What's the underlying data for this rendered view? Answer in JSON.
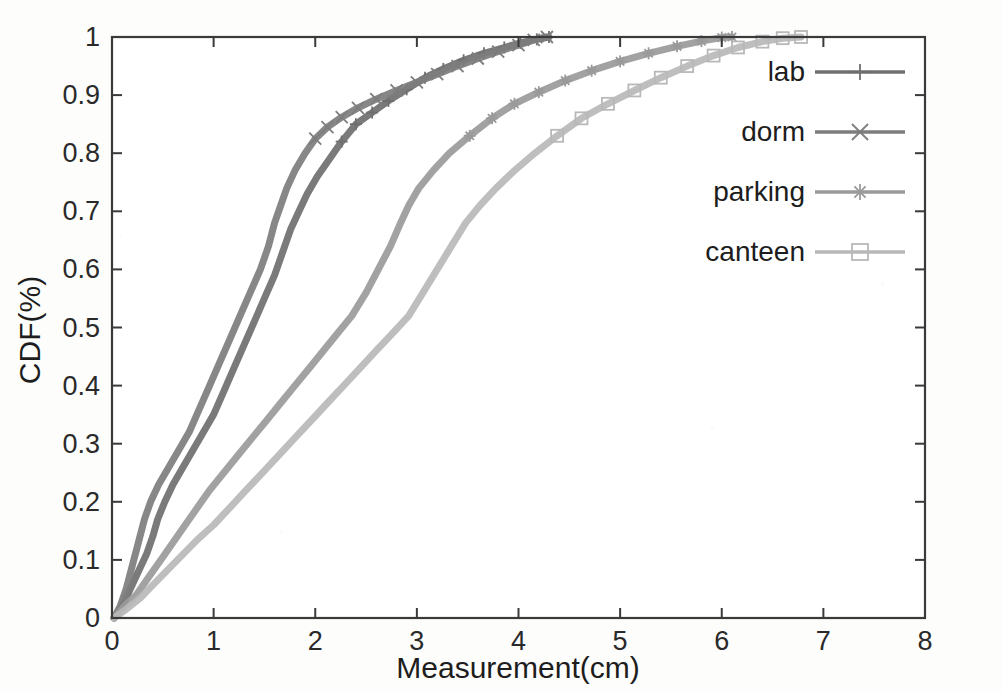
{
  "chart_data": {
    "type": "line",
    "title": "",
    "subtitle": "",
    "xlabel": "Measurement(cm)",
    "ylabel": "CDF(%)",
    "xlim": [
      0,
      8
    ],
    "ylim": [
      0,
      1
    ],
    "xticks": [
      "0",
      "1",
      "2",
      "3",
      "4",
      "5",
      "6",
      "7",
      "8"
    ],
    "xtick_values": [
      0,
      1,
      2,
      3,
      4,
      5,
      6,
      7,
      8
    ],
    "yticks": [
      "0",
      "0.1",
      "0.2",
      "0.3",
      "0.4",
      "0.5",
      "0.6",
      "0.7",
      "0.8",
      "0.9",
      "1"
    ],
    "ytick_values": [
      0,
      0.1,
      0.2,
      0.3,
      0.4,
      0.5,
      0.6,
      0.7,
      0.8,
      0.9,
      1
    ],
    "grid": false,
    "legend_position": "right",
    "series": [
      {
        "name": "lab",
        "marker": "plus",
        "color": "#6f6f6f",
        "points": [
          [
            0.02,
            0.0
          ],
          [
            0.1,
            0.02
          ],
          [
            0.18,
            0.05
          ],
          [
            0.26,
            0.08
          ],
          [
            0.34,
            0.11
          ],
          [
            0.4,
            0.14
          ],
          [
            0.45,
            0.17
          ],
          [
            0.52,
            0.2
          ],
          [
            0.6,
            0.23
          ],
          [
            0.7,
            0.26
          ],
          [
            0.8,
            0.29
          ],
          [
            0.9,
            0.32
          ],
          [
            1.0,
            0.35
          ],
          [
            1.1,
            0.39
          ],
          [
            1.2,
            0.43
          ],
          [
            1.3,
            0.47
          ],
          [
            1.4,
            0.51
          ],
          [
            1.5,
            0.55
          ],
          [
            1.6,
            0.59
          ],
          [
            1.68,
            0.63
          ],
          [
            1.76,
            0.67
          ],
          [
            1.84,
            0.7
          ],
          [
            1.92,
            0.73
          ],
          [
            2.02,
            0.76
          ],
          [
            2.14,
            0.79
          ],
          [
            2.26,
            0.82
          ],
          [
            2.4,
            0.85
          ],
          [
            2.56,
            0.87
          ],
          [
            2.72,
            0.89
          ],
          [
            2.9,
            0.91
          ],
          [
            3.08,
            0.93
          ],
          [
            3.26,
            0.945
          ],
          [
            3.46,
            0.96
          ],
          [
            3.66,
            0.972
          ],
          [
            3.86,
            0.982
          ],
          [
            4.02,
            0.99
          ],
          [
            4.18,
            0.996
          ],
          [
            4.3,
            1.0
          ]
        ]
      },
      {
        "name": "dorm",
        "marker": "cross",
        "color": "#7d7d7d",
        "points": [
          [
            0.02,
            0.0
          ],
          [
            0.08,
            0.02
          ],
          [
            0.14,
            0.05
          ],
          [
            0.2,
            0.09
          ],
          [
            0.26,
            0.13
          ],
          [
            0.32,
            0.17
          ],
          [
            0.38,
            0.2
          ],
          [
            0.46,
            0.23
          ],
          [
            0.56,
            0.26
          ],
          [
            0.66,
            0.29
          ],
          [
            0.76,
            0.32
          ],
          [
            0.86,
            0.36
          ],
          [
            0.96,
            0.4
          ],
          [
            1.06,
            0.44
          ],
          [
            1.16,
            0.48
          ],
          [
            1.26,
            0.52
          ],
          [
            1.36,
            0.56
          ],
          [
            1.46,
            0.6
          ],
          [
            1.54,
            0.64
          ],
          [
            1.6,
            0.68
          ],
          [
            1.66,
            0.71
          ],
          [
            1.72,
            0.74
          ],
          [
            1.8,
            0.77
          ],
          [
            1.9,
            0.8
          ],
          [
            2.0,
            0.825
          ],
          [
            2.12,
            0.845
          ],
          [
            2.26,
            0.862
          ],
          [
            2.42,
            0.878
          ],
          [
            2.6,
            0.893
          ],
          [
            2.8,
            0.908
          ],
          [
            3.0,
            0.922
          ],
          [
            3.2,
            0.936
          ],
          [
            3.4,
            0.95
          ],
          [
            3.6,
            0.963
          ],
          [
            3.8,
            0.975
          ],
          [
            4.0,
            0.986
          ],
          [
            4.15,
            0.995
          ],
          [
            4.28,
            1.0
          ]
        ]
      },
      {
        "name": "parking",
        "marker": "star",
        "color": "#9a9a9a",
        "points": [
          [
            0.02,
            0.0
          ],
          [
            0.12,
            0.02
          ],
          [
            0.24,
            0.04
          ],
          [
            0.36,
            0.07
          ],
          [
            0.48,
            0.1
          ],
          [
            0.6,
            0.13
          ],
          [
            0.72,
            0.16
          ],
          [
            0.84,
            0.19
          ],
          [
            0.96,
            0.22
          ],
          [
            1.1,
            0.25
          ],
          [
            1.24,
            0.28
          ],
          [
            1.38,
            0.31
          ],
          [
            1.52,
            0.34
          ],
          [
            1.66,
            0.37
          ],
          [
            1.8,
            0.4
          ],
          [
            1.94,
            0.43
          ],
          [
            2.08,
            0.46
          ],
          [
            2.22,
            0.49
          ],
          [
            2.36,
            0.52
          ],
          [
            2.5,
            0.56
          ],
          [
            2.62,
            0.6
          ],
          [
            2.74,
            0.64
          ],
          [
            2.84,
            0.68
          ],
          [
            2.92,
            0.71
          ],
          [
            3.02,
            0.74
          ],
          [
            3.16,
            0.77
          ],
          [
            3.32,
            0.8
          ],
          [
            3.52,
            0.83
          ],
          [
            3.74,
            0.86
          ],
          [
            3.96,
            0.885
          ],
          [
            4.2,
            0.905
          ],
          [
            4.46,
            0.925
          ],
          [
            4.72,
            0.942
          ],
          [
            5.0,
            0.958
          ],
          [
            5.28,
            0.972
          ],
          [
            5.56,
            0.984
          ],
          [
            5.8,
            0.993
          ],
          [
            6.0,
            0.999
          ],
          [
            6.1,
            1.0
          ]
        ]
      },
      {
        "name": "canteen",
        "marker": "square",
        "color": "#b8b8b8",
        "points": [
          [
            0.02,
            0.0
          ],
          [
            0.14,
            0.015
          ],
          [
            0.28,
            0.035
          ],
          [
            0.42,
            0.06
          ],
          [
            0.56,
            0.085
          ],
          [
            0.7,
            0.11
          ],
          [
            0.84,
            0.135
          ],
          [
            1.0,
            0.16
          ],
          [
            1.16,
            0.19
          ],
          [
            1.32,
            0.22
          ],
          [
            1.48,
            0.25
          ],
          [
            1.64,
            0.28
          ],
          [
            1.8,
            0.31
          ],
          [
            1.96,
            0.34
          ],
          [
            2.12,
            0.37
          ],
          [
            2.28,
            0.4
          ],
          [
            2.44,
            0.43
          ],
          [
            2.6,
            0.46
          ],
          [
            2.76,
            0.49
          ],
          [
            2.92,
            0.52
          ],
          [
            3.06,
            0.56
          ],
          [
            3.2,
            0.6
          ],
          [
            3.34,
            0.64
          ],
          [
            3.48,
            0.68
          ],
          [
            3.62,
            0.71
          ],
          [
            3.78,
            0.74
          ],
          [
            3.96,
            0.77
          ],
          [
            4.16,
            0.8
          ],
          [
            4.38,
            0.83
          ],
          [
            4.62,
            0.86
          ],
          [
            4.88,
            0.885
          ],
          [
            5.14,
            0.908
          ],
          [
            5.4,
            0.93
          ],
          [
            5.66,
            0.95
          ],
          [
            5.92,
            0.968
          ],
          [
            6.16,
            0.982
          ],
          [
            6.4,
            0.992
          ],
          [
            6.6,
            0.998
          ],
          [
            6.78,
            1.0
          ]
        ]
      }
    ]
  },
  "legend": {
    "entries": [
      {
        "label": "lab"
      },
      {
        "label": "dorm"
      },
      {
        "label": "parking"
      },
      {
        "label": "canteen"
      }
    ]
  },
  "axes": {
    "frame_color": "#3a3a3a"
  }
}
